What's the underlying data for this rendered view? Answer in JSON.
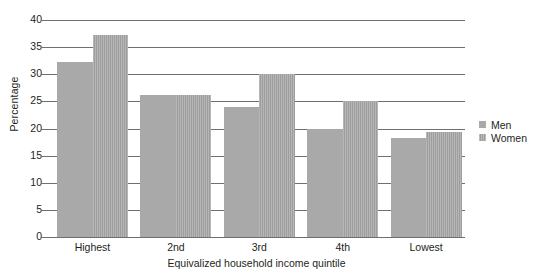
{
  "chart_data": {
    "type": "bar",
    "title": "",
    "xlabel": "Equivalized household income quintile",
    "ylabel": "Percentage",
    "categories": [
      "Highest",
      "2nd",
      "3rd",
      "4th",
      "Lowest"
    ],
    "series": [
      {
        "name": "Men",
        "values": [
          32.3,
          26.2,
          24.0,
          20.0,
          18.2
        ]
      },
      {
        "name": "Women",
        "values": [
          37.3,
          26.2,
          30.0,
          25.0,
          19.3
        ]
      }
    ],
    "ylim": [
      0,
      40
    ],
    "ytick_step": 5,
    "yticks": [
      "40",
      "35",
      "30",
      "25",
      "20",
      "15",
      "10",
      "5",
      "0"
    ],
    "grid": true,
    "grid_axis": "y",
    "legend_position": "right",
    "colors": {
      "men": "#a9a9a9",
      "women": "#a6a6a6",
      "axis": "#6f6f6f",
      "text": "#231f20",
      "background": "#ffffff"
    }
  },
  "legend": {
    "entries": [
      {
        "label": "Men",
        "swatch": "men"
      },
      {
        "label": "Women",
        "swatch": "women"
      }
    ]
  }
}
